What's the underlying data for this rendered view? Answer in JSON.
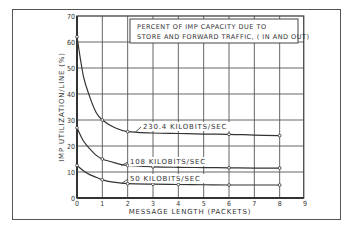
{
  "chart_data": {
    "type": "line",
    "title": "PERCENT OF IMP CAPACITY DUE TO STORE AND FORWARD TRAFFIC, ( IN AND OUT)",
    "title_lines": [
      "PERCENT OF IMP CAPACITY DUE TO",
      "STORE AND FORWARD TRAFFIC, ( IN AND OUT)"
    ],
    "xlabel": "MESSAGE LENGTH (PACKETS)",
    "ylabel": "IMP UTILIZATION/LINE (%)",
    "xlim": [
      0,
      9
    ],
    "ylim": [
      0,
      70
    ],
    "x_ticks": [
      0,
      1,
      2,
      3,
      4,
      5,
      6,
      7,
      8,
      9
    ],
    "y_ticks": [
      0,
      10,
      20,
      30,
      40,
      50,
      60,
      70
    ],
    "grid": true,
    "legend_position": "top-right box",
    "series": [
      {
        "name": "230.4 KILOBITS/SEC",
        "x": [
          0,
          0.25,
          0.5,
          0.75,
          1,
          1.5,
          2,
          3,
          4,
          5,
          6,
          7,
          8
        ],
        "y": [
          62,
          47,
          39,
          33,
          30,
          27,
          25.5,
          25,
          24.8,
          24.6,
          24.5,
          24.2,
          24
        ],
        "markers_at": [
          0,
          1,
          2,
          6,
          8
        ]
      },
      {
        "name": "108 KILOBITS/SEC",
        "x": [
          0,
          0.25,
          0.5,
          0.75,
          1,
          1.5,
          2,
          3,
          4,
          5,
          6,
          7,
          8
        ],
        "y": [
          27,
          22,
          19,
          16.5,
          15,
          13.5,
          12.5,
          12,
          11.8,
          11.7,
          11.6,
          11.5,
          11.5
        ],
        "markers_at": [
          0,
          1,
          2,
          3,
          6,
          8
        ]
      },
      {
        "name": "50 KILOBITS/SEC",
        "x": [
          0,
          0.25,
          0.5,
          0.75,
          1,
          1.5,
          2,
          3,
          4,
          5,
          6,
          7,
          8
        ],
        "y": [
          12.5,
          10.5,
          9,
          8,
          7,
          6,
          5.5,
          5.3,
          5.2,
          5.1,
          5,
          5,
          5
        ],
        "markers_at": [
          0,
          1,
          2,
          3,
          4,
          6,
          8
        ]
      }
    ],
    "annotations": [
      {
        "text": "230.4 KILOBITS/SEC",
        "series": 0
      },
      {
        "text": "108 KILOBITS/SEC",
        "series": 1
      },
      {
        "text": "50 KILOBITS/SEC",
        "series": 2
      }
    ]
  },
  "colors": {
    "line": "#333333",
    "grid": "#555555",
    "frame": "#555555",
    "background": "#ffffff"
  }
}
